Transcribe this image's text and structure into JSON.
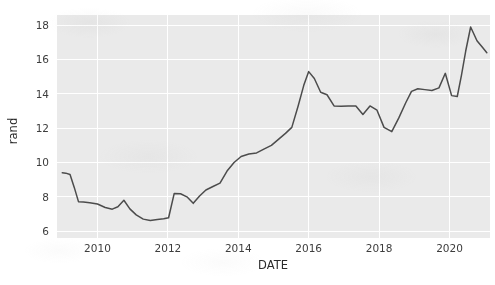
{
  "chart_data": {
    "type": "line",
    "title": "",
    "xlabel": "DATE",
    "ylabel": "rand",
    "xlim": [
      2008.85,
      2021.15
    ],
    "ylim": [
      5.6,
      18.6
    ],
    "xticks": [
      2010,
      2012,
      2014,
      2016,
      2018,
      2020
    ],
    "xtick_labels": [
      "2010",
      "2012",
      "2014",
      "2016",
      "2018",
      "2020"
    ],
    "yticks": [
      6,
      8,
      10,
      12,
      14,
      16,
      18
    ],
    "ytick_labels": [
      "6",
      "8",
      "10",
      "12",
      "14",
      "16",
      "18"
    ],
    "grid": true,
    "legend": false,
    "line_color": "#4c4c4c",
    "line_width": 1.5,
    "plot_bg_color": "#eaeaea",
    "figure_bg_color": "#ffffff",
    "grid_color": "#ffffff",
    "series": [
      {
        "name": "rand",
        "x": [
          2009.0,
          2009.1,
          2009.22,
          2009.34,
          2009.46,
          2009.6,
          2009.78,
          2010.0,
          2010.22,
          2010.42,
          2010.58,
          2010.75,
          2010.92,
          2011.1,
          2011.3,
          2011.5,
          2011.7,
          2011.88,
          2012.02,
          2012.18,
          2012.36,
          2012.54,
          2012.72,
          2012.9,
          2013.08,
          2013.28,
          2013.48,
          2013.68,
          2013.88,
          2014.08,
          2014.3,
          2014.52,
          2014.74,
          2014.94,
          2015.14,
          2015.34,
          2015.52,
          2015.7,
          2015.86,
          2016.0,
          2016.16,
          2016.34,
          2016.52,
          2016.72,
          2016.92,
          2017.12,
          2017.34,
          2017.54,
          2017.74,
          2017.94,
          2018.14,
          2018.36,
          2018.56,
          2018.76,
          2018.92,
          2019.1,
          2019.3,
          2019.5,
          2019.7,
          2019.88,
          2020.06,
          2020.22,
          2020.34,
          2020.46,
          2020.6,
          2020.78,
          2020.94,
          2021.06
        ],
        "y": [
          9.4,
          9.38,
          9.3,
          8.55,
          7.72,
          7.7,
          7.66,
          7.58,
          7.38,
          7.28,
          7.42,
          7.8,
          7.3,
          6.95,
          6.7,
          6.62,
          6.68,
          6.72,
          6.78,
          8.2,
          8.18,
          8.0,
          7.62,
          8.05,
          8.4,
          8.6,
          8.8,
          9.5,
          10.0,
          10.35,
          10.5,
          10.56,
          10.8,
          11.0,
          11.35,
          11.7,
          12.05,
          13.3,
          14.5,
          15.3,
          14.9,
          14.1,
          13.95,
          13.3,
          13.28,
          13.3,
          13.3,
          12.8,
          13.3,
          13.05,
          12.05,
          11.8,
          12.6,
          13.5,
          14.15,
          14.3,
          14.25,
          14.2,
          14.35,
          15.2,
          13.9,
          13.85,
          15.1,
          16.5,
          17.9,
          17.1,
          16.7,
          16.4
        ]
      }
    ]
  }
}
